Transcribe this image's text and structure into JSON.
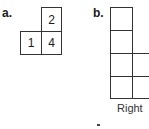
{
  "part_a": {
    "label": "a.",
    "cells": [
      {
        "value": "2",
        "position": "top-right"
      },
      {
        "value": "1",
        "position": "bottom-left"
      },
      {
        "value": "4",
        "position": "bottom-right"
      }
    ]
  },
  "part_b": {
    "label": "b.",
    "caption": "Right",
    "left_column_cells": 4,
    "right_column_cells": 2
  }
}
